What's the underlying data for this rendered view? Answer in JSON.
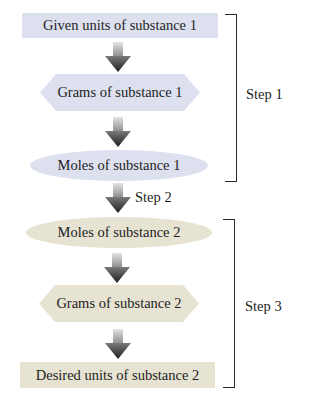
{
  "diagram": {
    "type": "flowchart",
    "nodes": [
      {
        "id": "n1",
        "label": "Given units of substance 1",
        "shape": "rectangle",
        "color": "#dde1ef"
      },
      {
        "id": "n2",
        "label": "Grams of substance 1",
        "shape": "hexagon",
        "color": "#dde1ef"
      },
      {
        "id": "n3",
        "label": "Moles of substance 1",
        "shape": "ellipse",
        "color": "#dde1ef"
      },
      {
        "id": "n4",
        "label": "Moles of substance 2",
        "shape": "ellipse",
        "color": "#e6e3d3"
      },
      {
        "id": "n5",
        "label": "Grams of substance 2",
        "shape": "hexagon",
        "color": "#e6e3d3"
      },
      {
        "id": "n6",
        "label": "Desired units of substance 2",
        "shape": "rectangle",
        "color": "#e6e3d3"
      }
    ],
    "edges": [
      {
        "from": "n1",
        "to": "n2"
      },
      {
        "from": "n2",
        "to": "n3"
      },
      {
        "from": "n3",
        "to": "n4",
        "label": "Step 2"
      },
      {
        "from": "n4",
        "to": "n5"
      },
      {
        "from": "n5",
        "to": "n6"
      }
    ],
    "groups": [
      {
        "label": "Step 1",
        "spans": [
          "n1",
          "n2",
          "n3"
        ]
      },
      {
        "label": "Step 3",
        "spans": [
          "n4",
          "n5",
          "n6"
        ]
      }
    ]
  },
  "labels": {
    "step1": "Step 1",
    "step2": "Step 2",
    "step3": "Step 3"
  },
  "colors": {
    "substance1": "#dde1ef",
    "substance2": "#e6e3d3",
    "arrow_dark": "#2e2e2e",
    "arrow_light": "#d8d8d8",
    "bracket": "#2a2a2a"
  }
}
